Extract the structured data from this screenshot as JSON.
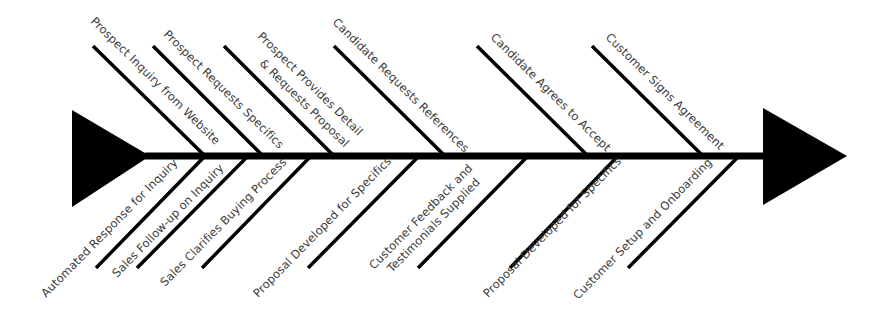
{
  "diagram": {
    "type": "fishbone",
    "colors": {
      "line": "#000000",
      "text": "#3a3a3a",
      "background": "#ffffff"
    },
    "head_icon": "triangle-arrow-right",
    "tail_icon": "triangle-tail",
    "top_bones": [
      {
        "label": "Prospect Inquiry from Website"
      },
      {
        "label": "Prospect Requests Specifics"
      },
      {
        "label_line1": "Prospect Provides Detail",
        "label_line2": "& Requests Proposal"
      },
      {
        "label": "Candidate Requests References"
      },
      {
        "label": "Candidate Agrees to Accept"
      },
      {
        "label": "Customer Signs Agreement"
      }
    ],
    "bottom_bones": [
      {
        "label": "Automated Response for Inquiry"
      },
      {
        "label": "Sales Follow-up on Inquiry"
      },
      {
        "label": "Sales Clarifies Buying Process"
      },
      {
        "label": "Proposal Developed for Specifics"
      },
      {
        "label_line1": "Customer Feedback and",
        "label_line2": "Testimonials Supplied"
      },
      {
        "label": "Proposal Developed for Specifics"
      },
      {
        "label": "Customer Setup and Onboarding"
      }
    ]
  }
}
